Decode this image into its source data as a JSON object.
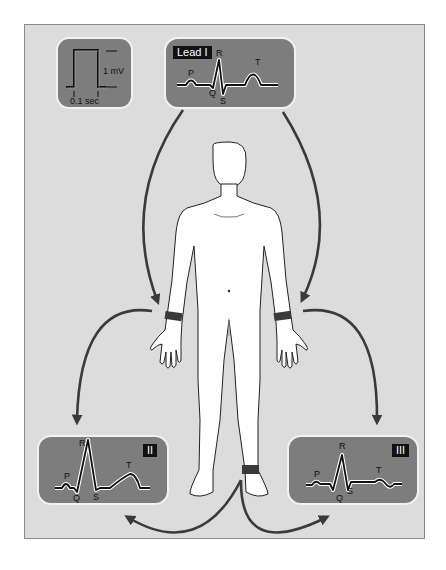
{
  "figure": {
    "background_color": "#dcdcdc",
    "panel_color": "#7d7d7d",
    "arrow_color": "#3a3a3a",
    "electrode_color": "#3a3a3a"
  },
  "calibration": {
    "amplitude_label": "1 mV",
    "time_label": "0.1 sec"
  },
  "panels": [
    {
      "id": "lead-1",
      "label": "Lead I",
      "waves": {
        "p": "P",
        "q": "Q",
        "r": "R",
        "s": "S",
        "t": "T"
      }
    },
    {
      "id": "lead-2",
      "label": "II",
      "waves": {
        "p": "P",
        "q": "Q",
        "r": "R",
        "s": "S",
        "t": "T"
      }
    },
    {
      "id": "lead-3",
      "label": "III",
      "waves": {
        "p": "P",
        "q": "Q",
        "r": "R",
        "s": "S",
        "t": "T"
      }
    }
  ],
  "electrodes": [
    "right-wrist",
    "left-wrist",
    "left-ankle"
  ]
}
